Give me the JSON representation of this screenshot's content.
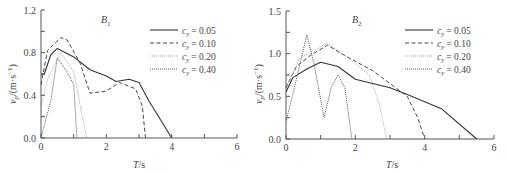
{
  "chart_data": [
    {
      "type": "line",
      "title": "B1",
      "title_main": "B",
      "title_sub": "1",
      "xlabel": "T/s",
      "ylabel": "v_p/(m·s⁻¹)",
      "xlim": [
        0,
        6
      ],
      "ylim": [
        0,
        1.2
      ],
      "xticks": [
        "0",
        "2",
        "4",
        "6"
      ],
      "yticks": [
        "0.0",
        "0.4",
        "0.8",
        "1.2"
      ],
      "grid": false,
      "legend_position": "upper right",
      "series": [
        {
          "name": "c_y = 0.05",
          "label_value": "= 0.05",
          "style": "solid",
          "x": [
            0,
            0.1,
            0.3,
            0.5,
            1.0,
            1.5,
            2.0,
            2.3,
            2.7,
            3.0,
            3.3,
            3.7,
            4.0
          ],
          "y": [
            0.6,
            0.6,
            0.78,
            0.84,
            0.76,
            0.64,
            0.58,
            0.53,
            0.55,
            0.52,
            0.35,
            0.15,
            0.0
          ]
        },
        {
          "name": "c_y = 0.10",
          "label_value": "= 0.10",
          "style": "dashed",
          "x": [
            0,
            0.2,
            0.6,
            0.8,
            1.2,
            1.5,
            2.0,
            2.4,
            2.9,
            3.1,
            3.2
          ],
          "y": [
            0.5,
            0.82,
            0.94,
            0.92,
            0.7,
            0.42,
            0.44,
            0.52,
            0.46,
            0.3,
            0.0
          ]
        },
        {
          "name": "c_y = 0.20",
          "label_value": "= 0.20",
          "style": "dotted-light",
          "x": [
            0,
            0.2,
            0.6,
            1.0,
            1.2,
            1.4
          ],
          "y": [
            0.3,
            0.55,
            0.8,
            0.62,
            0.3,
            0.0
          ]
        },
        {
          "name": "c_y = 0.40",
          "label_value": "= 0.40",
          "style": "dotted-dark",
          "x": [
            0,
            0.3,
            0.5,
            0.8,
            1.0,
            1.1
          ],
          "y": [
            0.0,
            0.35,
            0.75,
            0.62,
            0.5,
            0.0
          ]
        }
      ]
    },
    {
      "type": "line",
      "title": "B2",
      "title_main": "B",
      "title_sub": "2",
      "xlabel": "T/s",
      "ylabel": "v_p/(m·s⁻¹)",
      "xlim": [
        0,
        6
      ],
      "ylim": [
        0,
        1.5
      ],
      "xticks": [
        "0",
        "2",
        "4",
        "6"
      ],
      "yticks": [
        "0.0",
        "0.5",
        "1.0",
        "1.5"
      ],
      "grid": false,
      "legend_position": "upper right",
      "series": [
        {
          "name": "c_y = 0.05",
          "label_value": "= 0.05",
          "style": "solid",
          "x": [
            0,
            0.2,
            0.6,
            1.0,
            1.5,
            2.0,
            3.0,
            3.5,
            4.5,
            5.5
          ],
          "y": [
            0.55,
            0.72,
            0.82,
            0.9,
            0.85,
            0.7,
            0.6,
            0.52,
            0.35,
            0.0
          ]
        },
        {
          "name": "c_y = 0.10",
          "label_value": "= 0.10",
          "style": "dashed",
          "x": [
            0,
            0.3,
            0.7,
            1.2,
            1.6,
            2.5,
            3.5,
            3.8,
            4.0
          ],
          "y": [
            0.6,
            0.85,
            0.98,
            1.1,
            1.0,
            0.8,
            0.5,
            0.25,
            0.0
          ]
        },
        {
          "name": "c_y = 0.20",
          "label_value": "= 0.20",
          "style": "dotted-light",
          "x": [
            0,
            0.4,
            1.2,
            1.8,
            2.4,
            2.7,
            2.9
          ],
          "y": [
            0.6,
            0.95,
            1.12,
            0.95,
            0.75,
            0.4,
            0.0
          ]
        },
        {
          "name": "c_y = 0.40",
          "label_value": "= 0.40",
          "style": "dotted-dark",
          "x": [
            0,
            0.3,
            0.6,
            0.8,
            1.1,
            1.3,
            1.5,
            1.7,
            1.9
          ],
          "y": [
            0.2,
            0.7,
            1.22,
            0.9,
            0.25,
            0.6,
            0.75,
            0.6,
            0.0
          ]
        }
      ]
    }
  ],
  "labels": {
    "legend_symbol": "c",
    "legend_sub": "y",
    "ylabel_main": "v",
    "ylabel_sub": "p",
    "ylabel_unit": "/(m·s",
    "ylabel_exp": "−1",
    "ylabel_close": ")",
    "xlabel_main": "T",
    "xlabel_unit": "/s"
  },
  "colors": {
    "axis": "#555555",
    "solid": "#333333",
    "dashed": "#444444",
    "dotted_light": "#aaaaaa",
    "dotted_dark": "#555555"
  }
}
